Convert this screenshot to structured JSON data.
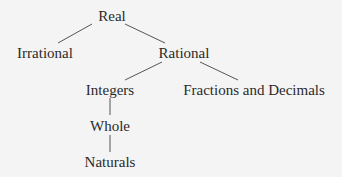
{
  "diagram": {
    "type": "tree",
    "colors": {
      "background": "#f4f4f4",
      "text": "#2a2a2a",
      "line": "#555555"
    },
    "nodes": {
      "real": {
        "label": "Real"
      },
      "irrational": {
        "label": "Irrational"
      },
      "rational": {
        "label": "Rational"
      },
      "integers": {
        "label": "Integers"
      },
      "fractions": {
        "label": "Fractions and Decimals"
      },
      "whole": {
        "label": "Whole"
      },
      "naturals": {
        "label": "Naturals"
      }
    },
    "edges": [
      {
        "from": "Real",
        "to": "Irrational"
      },
      {
        "from": "Real",
        "to": "Rational"
      },
      {
        "from": "Rational",
        "to": "Integers"
      },
      {
        "from": "Rational",
        "to": "Fractions and Decimals"
      },
      {
        "from": "Integers",
        "to": "Whole"
      },
      {
        "from": "Whole",
        "to": "Naturals"
      }
    ]
  }
}
